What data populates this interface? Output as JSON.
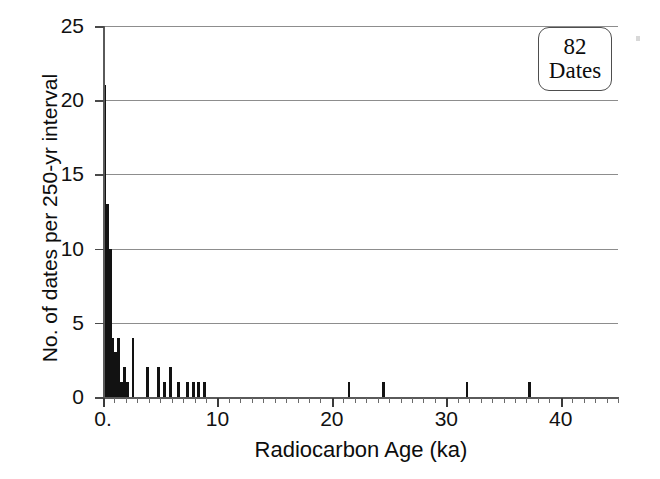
{
  "figure": {
    "background": "#ffffff",
    "bar_color": "#121212",
    "grid_color": "#8d8d8d",
    "axis_color": "#5a5a5a"
  },
  "annotation": {
    "count": "82",
    "label": "Dates"
  },
  "chart_data": {
    "type": "bar",
    "title": "",
    "subtitle": "",
    "xlabel": "Radiocarbon Age (ka)",
    "ylabel": "No. of dates per 250-yr interval",
    "xlim": [
      0,
      45
    ],
    "ylim": [
      0,
      25
    ],
    "grid": true,
    "grid_axis": "y",
    "legend": "none",
    "bin_width_ka": 0.25,
    "bin_width_note": "250-yr interval",
    "total_dates": 82,
    "x_tick_labels": [
      "0.",
      "10",
      "20",
      "30",
      "40"
    ],
    "x_ticks_major": [
      0,
      10,
      20,
      30,
      40
    ],
    "x_tick_minor_step": 1,
    "y_tick_labels": [
      "0",
      "5",
      "10",
      "15",
      "20",
      "25"
    ],
    "y_ticks": [
      0,
      5,
      10,
      15,
      20,
      25
    ],
    "annotations": [
      {
        "text": "82 Dates",
        "position": "top-right"
      }
    ],
    "bars": [
      {
        "x": 0.125,
        "value": 21
      },
      {
        "x": 0.375,
        "value": 13
      },
      {
        "x": 0.625,
        "value": 10
      },
      {
        "x": 0.875,
        "value": 4
      },
      {
        "x": 1.125,
        "value": 3
      },
      {
        "x": 1.375,
        "value": 4
      },
      {
        "x": 1.625,
        "value": 1
      },
      {
        "x": 1.875,
        "value": 2
      },
      {
        "x": 2.125,
        "value": 1
      },
      {
        "x": 2.625,
        "value": 4
      },
      {
        "x": 3.875,
        "value": 2
      },
      {
        "x": 4.875,
        "value": 2
      },
      {
        "x": 5.375,
        "value": 1
      },
      {
        "x": 5.875,
        "value": 2
      },
      {
        "x": 6.625,
        "value": 1
      },
      {
        "x": 7.375,
        "value": 1
      },
      {
        "x": 7.875,
        "value": 1
      },
      {
        "x": 8.375,
        "value": 1
      },
      {
        "x": 8.875,
        "value": 1
      },
      {
        "x": 21.5,
        "value": 1
      },
      {
        "x": 24.5,
        "value": 1
      },
      {
        "x": 31.8,
        "value": 1
      },
      {
        "x": 37.3,
        "value": 1
      }
    ],
    "categories": [
      "0.125",
      "0.375",
      "0.625",
      "0.875",
      "1.125",
      "1.375",
      "1.625",
      "1.875",
      "2.125",
      "2.625",
      "3.875",
      "4.875",
      "5.375",
      "5.875",
      "6.625",
      "7.375",
      "7.875",
      "8.375",
      "8.875",
      "21.5",
      "24.5",
      "31.8",
      "37.3"
    ],
    "values": [
      21,
      13,
      10,
      4,
      3,
      4,
      1,
      2,
      1,
      4,
      2,
      2,
      1,
      2,
      1,
      1,
      1,
      1,
      1,
      1,
      1,
      1,
      1
    ]
  }
}
